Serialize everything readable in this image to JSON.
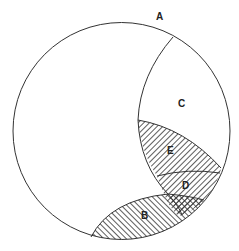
{
  "diagram": {
    "type": "venn-region-diagram",
    "colors": {
      "stroke": "#333333",
      "background": "#ffffff",
      "hatch": "#333333"
    },
    "labels": {
      "a": "A",
      "b": "B",
      "c": "C",
      "d": "D",
      "e": "E"
    },
    "regions": [
      {
        "id": "A",
        "fill": "none",
        "description": "outer circle"
      },
      {
        "id": "B",
        "fill": "hatch-backslash",
        "description": "lower lens"
      },
      {
        "id": "C",
        "fill": "none",
        "description": "upper right crescent"
      },
      {
        "id": "D",
        "fill": "hatch-slash",
        "description": "lower right band"
      },
      {
        "id": "E",
        "fill": "hatch-slash",
        "description": "middle right lens"
      },
      {
        "id": "B∩D",
        "fill": "crosshatch",
        "description": "overlap of B and D"
      }
    ]
  }
}
